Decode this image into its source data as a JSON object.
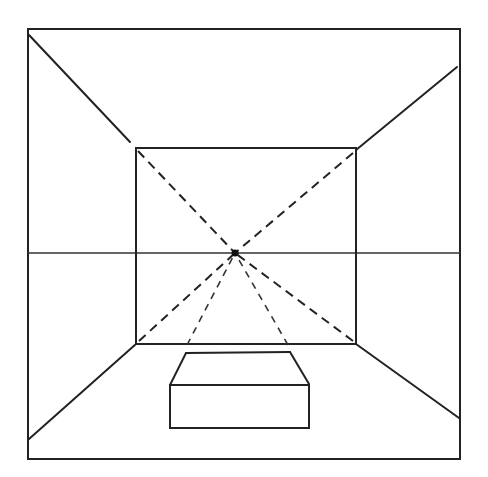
{
  "diagram": {
    "title": "One-point perspective room with box",
    "type": "perspective-drawing",
    "stroke_color": "#222222",
    "background": "#ffffff",
    "vanishing_point": {
      "x": 235,
      "y": 253,
      "label": "vanishing point"
    },
    "horizon_line": {
      "y": 253,
      "x1": 28,
      "x2": 460,
      "label": "horizon line"
    },
    "outer_frame": {
      "x1": 28,
      "y1": 29,
      "x2": 460,
      "y2": 459,
      "label": "picture plane frame"
    },
    "back_wall": {
      "x1": 136,
      "y1": 148,
      "x2": 356,
      "y2": 344,
      "label": "back wall"
    },
    "room_edges": [
      {
        "from": [
          29,
          35
        ],
        "to": [
          130,
          142
        ],
        "label": "ceiling-left edge"
      },
      {
        "from": [
          457,
          67
        ],
        "to": [
          356,
          150
        ],
        "label": "ceiling-right edge"
      },
      {
        "from": [
          29,
          439
        ],
        "to": [
          136,
          344
        ],
        "label": "floor-left edge"
      },
      {
        "from": [
          356,
          344
        ],
        "to": [
          459,
          418
        ],
        "label": "floor-right edge"
      }
    ],
    "construction_lines": [
      {
        "from": [
          136,
          148
        ],
        "to": [
          235,
          253
        ]
      },
      {
        "from": [
          356,
          150
        ],
        "to": [
          235,
          253
        ]
      },
      {
        "from": [
          136,
          344
        ],
        "to": [
          235,
          253
        ]
      },
      {
        "from": [
          356,
          344
        ],
        "to": [
          235,
          253
        ]
      },
      {
        "from": [
          187,
          345
        ],
        "to": [
          235,
          253
        ]
      },
      {
        "from": [
          288,
          345
        ],
        "to": [
          235,
          253
        ]
      }
    ],
    "box": {
      "label": "box on floor",
      "back_top": {
        "x1": 186,
        "x2": 290,
        "y": 353
      },
      "front_top": {
        "x1": 170,
        "x2": 309,
        "y": 385
      },
      "bottom_y": 428
    }
  }
}
